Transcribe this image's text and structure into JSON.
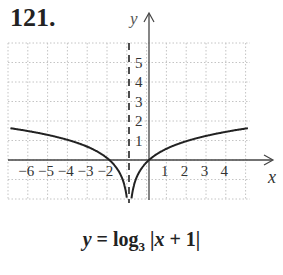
{
  "problem": {
    "number": "121."
  },
  "chart_data": {
    "type": "line",
    "title": "",
    "function": "y = log3|x + 1|",
    "caption_parts": {
      "lhs": "y",
      "eq": " = log",
      "base": "3",
      "arg_open": " |",
      "var": "x",
      "arg_rest": " + 1|"
    },
    "xlabel": "x",
    "ylabel": "y",
    "x_ticks": [
      -6,
      -5,
      -4,
      -3,
      -2,
      1,
      2,
      3,
      4
    ],
    "x_tick_labels": [
      "−6",
      "−5",
      "−4",
      "−3",
      "−2",
      "1",
      "2",
      "3",
      "4"
    ],
    "y_ticks": [
      1,
      2,
      3,
      4,
      5
    ],
    "y_tick_labels": [
      "1",
      "2",
      "3",
      "4",
      "5"
    ],
    "xlim": [
      -7,
      5
    ],
    "ylim": [
      -2,
      6
    ],
    "grid": true,
    "asymptote": {
      "type": "vertical",
      "x": -1,
      "style": "dashed"
    },
    "series": [
      {
        "name": "left branch",
        "x": [
          -7,
          -6,
          -5,
          -4,
          -3,
          -2,
          -1.5,
          -1.2,
          -1.1
        ],
        "y": [
          1.63,
          1.46,
          1.26,
          1.0,
          0.63,
          0,
          -0.63,
          -1.46,
          -2.1
        ]
      },
      {
        "name": "right branch",
        "x": [
          -0.9,
          -0.8,
          -0.5,
          0,
          1,
          2,
          3,
          4,
          5
        ],
        "y": [
          -2.1,
          -1.46,
          -0.63,
          0,
          0.63,
          1.0,
          1.26,
          1.46,
          1.63
        ]
      }
    ],
    "colors": {
      "curve": "#222222",
      "axis": "#333333",
      "grid": "#bbbbbb"
    }
  }
}
